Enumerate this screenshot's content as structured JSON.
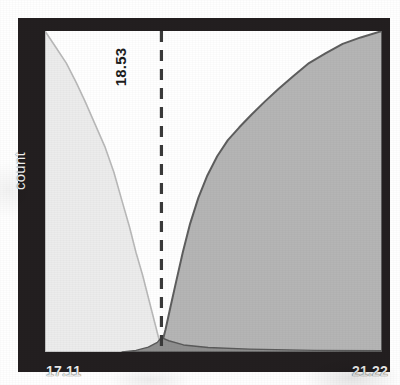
{
  "figure": {
    "ylabel": "count",
    "threshold_label": "18.53",
    "xtick_min": "17.11",
    "xtick_max": "21.22"
  },
  "colors": {
    "frame": "#231f20",
    "plot_background": "#ffffff",
    "left_area_fill": "#ececec",
    "left_area_stroke": "#b9b9b9",
    "right_area_fill": "#b5b5b5",
    "right_area_stroke": "#5e5e5e",
    "threshold_line": "#3a3a3a",
    "axis_text": "#ededed"
  },
  "chart_data": {
    "type": "area",
    "title": "",
    "xlabel": "",
    "ylabel": "count",
    "xlim": [
      17.11,
      21.22
    ],
    "ylim": [
      0,
      1
    ],
    "grid": false,
    "legend": null,
    "tick_labels": {
      "x": [
        "17.11",
        "21.22"
      ],
      "y": []
    },
    "annotations": [
      {
        "type": "vline",
        "label": "18.53",
        "x": 18.53,
        "style": "dashed",
        "label_rotation": -90
      }
    ],
    "series": [
      {
        "name": "left-descending-count",
        "fill": "#ececec",
        "stroke": "#b9b9b9",
        "x": [
          17.11,
          17.24,
          17.37,
          17.49,
          17.6,
          17.72,
          17.84,
          17.95,
          18.05,
          18.14,
          18.22,
          18.3,
          18.37,
          18.43,
          18.48,
          18.51,
          18.53
        ],
        "values": [
          1.0,
          0.95,
          0.9,
          0.84,
          0.78,
          0.71,
          0.64,
          0.56,
          0.47,
          0.39,
          0.31,
          0.24,
          0.17,
          0.11,
          0.06,
          0.03,
          0.01
        ]
      },
      {
        "name": "right-ascending-count",
        "fill": "#b5b5b5",
        "stroke": "#5e5e5e",
        "x": [
          18.53,
          18.58,
          18.64,
          18.71,
          18.79,
          18.88,
          18.98,
          19.09,
          19.21,
          19.34,
          19.48,
          19.63,
          19.79,
          19.96,
          20.14,
          20.33,
          20.53,
          20.74,
          20.96,
          21.22
        ],
        "values": [
          0.02,
          0.07,
          0.14,
          0.22,
          0.31,
          0.4,
          0.48,
          0.55,
          0.61,
          0.66,
          0.7,
          0.74,
          0.78,
          0.82,
          0.86,
          0.9,
          0.93,
          0.96,
          0.98,
          1.0
        ]
      },
      {
        "name": "baseline-bump",
        "fill": "#8c8c8c",
        "stroke": "#5a5a5a",
        "x": [
          18.05,
          18.22,
          18.37,
          18.48,
          18.53,
          18.62,
          18.8,
          19.1,
          19.6,
          20.4,
          21.22
        ],
        "values": [
          0.0,
          0.005,
          0.015,
          0.03,
          0.045,
          0.035,
          0.022,
          0.014,
          0.009,
          0.005,
          0.004
        ]
      }
    ]
  }
}
